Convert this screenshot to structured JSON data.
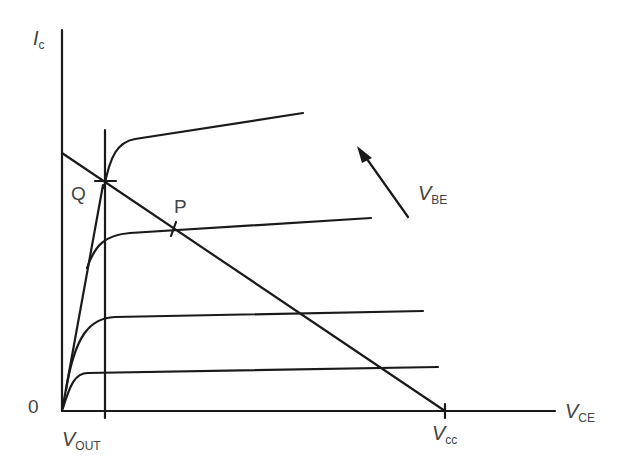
{
  "diagram": {
    "axes": {
      "y_label_main": "I",
      "y_label_sub": "c",
      "x_label_main": "V",
      "x_label_sub": "CE",
      "origin_label": "0"
    },
    "markers": {
      "vout_main": "V",
      "vout_sub": "OUT",
      "vcc_main": "V",
      "vcc_sub": "cc"
    },
    "points": {
      "q_label": "Q",
      "p_label": "P"
    },
    "arrow": {
      "label_main": "V",
      "label_sub": "BE"
    },
    "colors": {
      "line": "#1a1a1a",
      "text": "#444444"
    }
  }
}
